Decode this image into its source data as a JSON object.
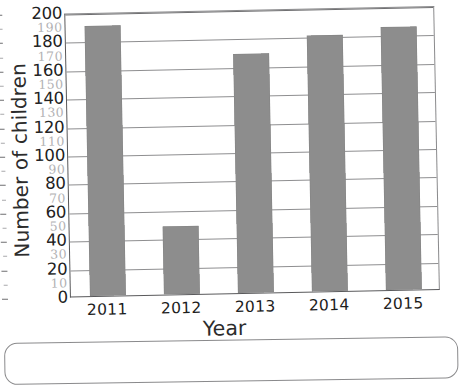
{
  "chart_data": {
    "type": "bar",
    "title": "",
    "xlabel": "Year",
    "ylabel": "Number of children",
    "categories": [
      "2011",
      "2012",
      "2013",
      "2014",
      "2015"
    ],
    "values": [
      190,
      48,
      168,
      180,
      185
    ],
    "ylim": [
      0,
      200
    ],
    "y_major_ticks": [
      200,
      180,
      160,
      140,
      120,
      100,
      80,
      60,
      40,
      20,
      0
    ],
    "y_minor_ticks": [
      190,
      170,
      150,
      130,
      110,
      90,
      70,
      50,
      30,
      10
    ],
    "grid": true,
    "legend": "none",
    "bar_color": "#8d8d8d",
    "axis_color": "#59595b",
    "gridline_color": "#8e8e90",
    "minor_label_color": "#b2b2b4",
    "note": "Minor tick labels appear as faint handwritten pencil annotations on the scanned worksheet."
  },
  "axes": {
    "y_title": "Number of children",
    "x_title": "Year"
  },
  "bars": [
    {
      "category": "2011",
      "value": 190
    },
    {
      "category": "2012",
      "value": 48
    },
    {
      "category": "2013",
      "value": 168
    },
    {
      "category": "2014",
      "value": 180
    },
    {
      "category": "2015",
      "value": 185
    }
  ],
  "y_major": [
    {
      "label": "200",
      "value": 200
    },
    {
      "label": "180",
      "value": 180
    },
    {
      "label": "160",
      "value": 160
    },
    {
      "label": "140",
      "value": 140
    },
    {
      "label": "120",
      "value": 120
    },
    {
      "label": "100",
      "value": 100
    },
    {
      "label": "80",
      "value": 80
    },
    {
      "label": "60",
      "value": 60
    },
    {
      "label": "40",
      "value": 40
    },
    {
      "label": "20",
      "value": 20
    },
    {
      "label": "0",
      "value": 0
    }
  ],
  "y_minor": [
    {
      "label": "190",
      "value": 190
    },
    {
      "label": "170",
      "value": 170
    },
    {
      "label": "150",
      "value": 150
    },
    {
      "label": "130",
      "value": 130
    },
    {
      "label": "110",
      "value": 110
    },
    {
      "label": "90",
      "value": 90
    },
    {
      "label": "70",
      "value": 70
    },
    {
      "label": "50",
      "value": 50
    },
    {
      "label": "30",
      "value": 30
    },
    {
      "label": "10",
      "value": 10
    }
  ],
  "answer_box": {
    "content": ""
  }
}
